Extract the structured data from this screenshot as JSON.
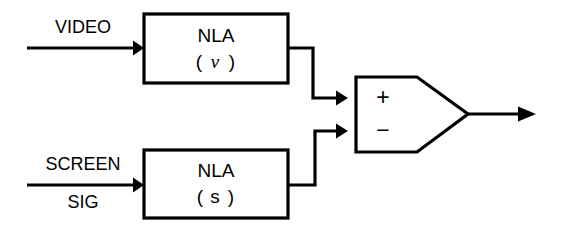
{
  "diagram": {
    "type": "block-diagram",
    "background_color": "#ffffff",
    "line_color": "#000000",
    "inputs": [
      {
        "id": "video",
        "label_line1": "VIDEO",
        "label_line2": "",
        "target": "nla-v"
      },
      {
        "id": "screen-sig",
        "label_line1": "SCREEN",
        "label_line2": "SIG",
        "target": "nla-s"
      }
    ],
    "blocks": [
      {
        "id": "nla-v",
        "line1": "NLA",
        "line2_open": "(",
        "line2_symbol": "ν",
        "line2_close": ")"
      },
      {
        "id": "nla-s",
        "line1": "NLA",
        "line2_open": "(",
        "line2_symbol": "s",
        "line2_close": ")"
      }
    ],
    "amplifier": {
      "id": "difference-amp",
      "plus_label": "+",
      "minus_label": "−",
      "plus_input_from": "nla-v",
      "minus_input_from": "nla-s"
    },
    "output": {
      "id": "amp-output",
      "label": ""
    }
  }
}
